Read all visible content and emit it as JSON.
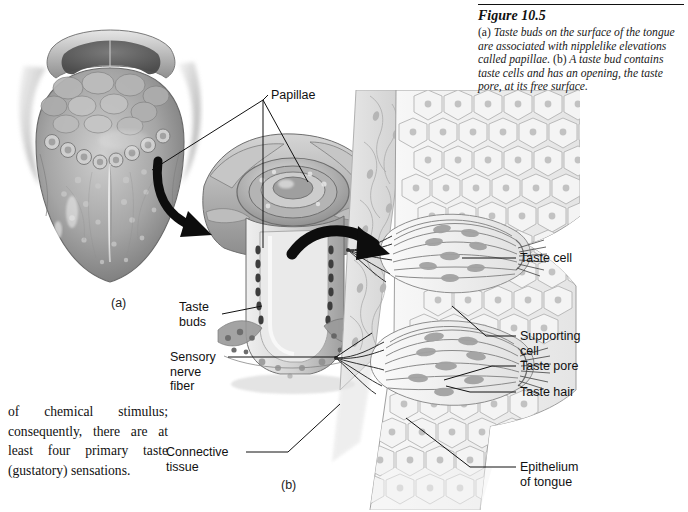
{
  "figure": {
    "title": "Figure 10.5",
    "caption_parts": {
      "a_marker": "(a)",
      "a_text": " Taste buds on the surface of the tongue are associated with nipplelike elevations called papillae. ",
      "b_marker": "(b)",
      "b_text": " A taste bud contains taste cells and has an opening, the taste pore, at its free surface."
    },
    "caption_full": "(a) Taste buds on the surface of the tongue are associated with nipplelike elevations called papillae. (b) A taste bud contains taste cells and has an opening, the taste pore, at its free surface."
  },
  "body_text": {
    "paragraph": "of chemical stimulus; consequently, there are at least four primary taste (gustatory) sensations."
  },
  "panels": {
    "a_label": "(a)",
    "b_label": "(b)"
  },
  "labels": {
    "papillae": "Papillae",
    "taste_buds": "Taste\nbuds",
    "sensory_nerve_fiber": "Sensory\nnerve\nfiber",
    "connective_tissue": "Connective\ntissue",
    "taste_cell": "Taste cell",
    "supporting_cell": "Supporting\ncell",
    "taste_pore": "Taste pore",
    "taste_hair": "Taste hair",
    "epithelium_of_tongue": "Epithelium\nof tongue"
  },
  "colors": {
    "ink": "#111111",
    "background": "#ffffff",
    "tissue_mid": "#9a9a9a",
    "tissue_dark": "#5d5d5d",
    "tissue_light": "#d8d8d8",
    "epithelium_fill": "#f0f0f0",
    "epithelium_stroke": "#a8a8a8",
    "nucleus": "#b9b9b9",
    "arrow": "#0d0d0d"
  }
}
